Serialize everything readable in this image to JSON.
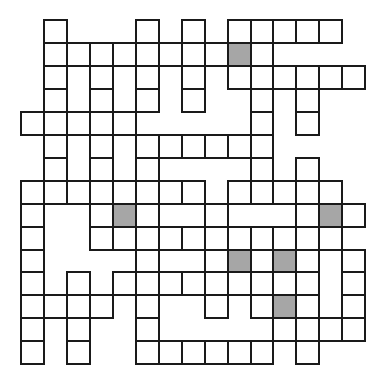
{
  "puzzle": {
    "type": "crossword-grid",
    "rows": 15,
    "cols": 15,
    "cell_size_px": 23,
    "colors": {
      "cell": "#ffffff",
      "shaded": "#a6a6a6",
      "border": "#1a1a1a",
      "background": "#ffffff"
    },
    "legend": {
      "#": "white cell",
      "S": "shaded cell",
      ".": "blank"
    },
    "grid": [
      ".#...#.#.#####.",
      ".########S#....",
      ".#.#.#.#.######",
      ".#.#.#.#..#.#..",
      "#####.....#.#..",
      ".#.#.######....",
      ".#.#.#....#.#..",
      "########.#####.",
      "#..#S#..#...#S#",
      "#..###########",
      "#....#..#S#S#.#",
      "#.#.#########.#",
      "####.#..#.#S#.#",
      "#.#..#.....####",
      "#.#..######.#.."
    ]
  }
}
